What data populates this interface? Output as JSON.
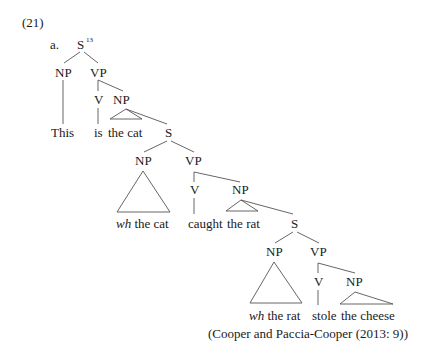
{
  "example": {
    "number": "(21)",
    "label": "a."
  },
  "tree": {
    "root": {
      "label": "S",
      "superscript": "13"
    },
    "level1": {
      "np": "NP",
      "vp": "VP",
      "np_terminal": "This",
      "v": "V",
      "v_terminal": "is",
      "np2": "NP",
      "np2_terminal": "the cat",
      "s": "S"
    },
    "level2": {
      "np": "NP",
      "np_terminal_italic": "wh",
      "np_terminal_rest": "the cat",
      "vp": "VP",
      "v": "V",
      "v_terminal": "caught",
      "np2": "NP",
      "np2_terminal": "the rat",
      "s": "S"
    },
    "level3": {
      "np": "NP",
      "np_terminal_italic": "wh",
      "np_terminal_rest": "the rat",
      "vp": "VP",
      "v": "V",
      "v_terminal": "stole",
      "np2": "NP",
      "np2_terminal": "the cheese"
    }
  },
  "citation": "(Cooper and Paccia-Cooper (2013: 9))"
}
